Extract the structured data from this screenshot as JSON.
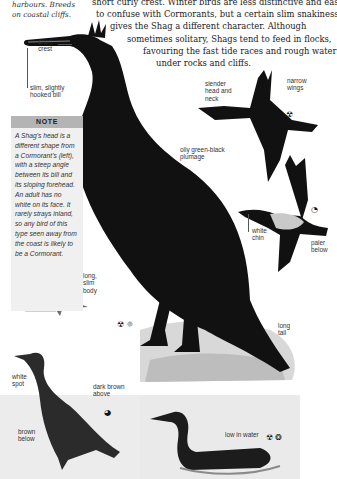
{
  "intro_left": {
    "lines": [
      "harbours. Breeds",
      "on coastal cliffs."
    ]
  },
  "body_text": {
    "lines": [
      "short curly crest. Winter birds are less distinctive and easier",
      "to confuse with Cormorants, but a certain slim snakiness",
      "gives the Shag a different character. Although",
      "sometimes solitary, Shags tend to feed in flocks,",
      "favouring the fast tide races and rough water",
      "under rocks and cliffs."
    ]
  },
  "note": {
    "heading": "NOTE",
    "lines": [
      "A Shag's head is a",
      "different shape from",
      "a Cormorant's (left),",
      "with a steep angle",
      "between its bill and",
      "its sloping forehead.",
      "An adult has no",
      "white on its face. It",
      "rarely strays inland,",
      "so any bird of this",
      "type seen away from",
      "the coast is likely to",
      "be a Cormorant."
    ]
  },
  "labels": {
    "short_crest": [
      "short",
      "crest"
    ],
    "bill": [
      "slim, slightly",
      "hooked bill"
    ],
    "narrow_wings": [
      "narrow",
      "wings"
    ],
    "slender_head": [
      "slender",
      "head and",
      "neck"
    ],
    "oily_plumage": [
      "oily green-black",
      "plumage"
    ],
    "white_chin": [
      "white",
      "chin"
    ],
    "paler_below": [
      "paler",
      "below"
    ],
    "long_body": [
      "long,",
      "slim",
      "body"
    ],
    "long_tail": [
      "long",
      "tail"
    ],
    "white_spot": [
      "white",
      "spot"
    ],
    "dark_brown_above": [
      "dark brown",
      "above"
    ],
    "brown_below": [
      "brown",
      "below"
    ],
    "low_in_water": [
      "low in water"
    ]
  },
  "season_icons": {
    "main": [
      "☢",
      "☼"
    ],
    "flight_top": [
      "☢"
    ],
    "flight_mid": [
      "◔"
    ],
    "juvenile": [
      "◕"
    ],
    "swimming": [
      "☢",
      "❂"
    ]
  }
}
